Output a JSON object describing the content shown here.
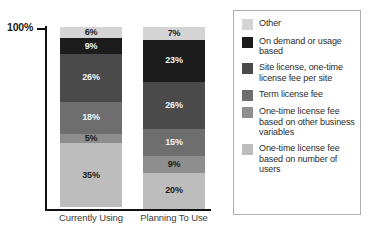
{
  "chart_data": {
    "type": "bar",
    "stacked": true,
    "normalized_percent": true,
    "title": "",
    "subtitle": "",
    "xlabel": "",
    "ylabel": "",
    "categories": [
      "Currently Using",
      "Planning To Use"
    ],
    "ylim": [
      0,
      100
    ],
    "ytick_labels": [
      "100%"
    ],
    "grid": false,
    "legend_position": "right",
    "series": [
      {
        "name": "One-time license fee based on number of users",
        "color": "#bdbdbd",
        "label_color": "dark",
        "values": [
          35,
          20
        ],
        "value_labels": [
          "35%",
          "20%"
        ]
      },
      {
        "name": "One-time license fee based on other business variables",
        "color": "#8e8e8e",
        "label_color": "dark",
        "values": [
          5,
          9
        ],
        "value_labels": [
          "5%",
          "9%"
        ]
      },
      {
        "name": "Term license fee",
        "color": "#6e6e6e",
        "label_color": "light",
        "values": [
          18,
          15
        ],
        "value_labels": [
          "18%",
          "15%"
        ]
      },
      {
        "name": "Site license, one-time license fee per site",
        "color": "#4a4a4a",
        "label_color": "light",
        "values": [
          26,
          26
        ],
        "value_labels": [
          "26%",
          "26%"
        ]
      },
      {
        "name": "On demand or usage based",
        "color": "#1c1c1c",
        "label_color": "light",
        "values": [
          9,
          23
        ],
        "value_labels": [
          "9%",
          "23%"
        ]
      },
      {
        "name": "Other",
        "color": "#d4d4d4",
        "label_color": "dark",
        "values": [
          6,
          7
        ],
        "value_labels": [
          "6%",
          "7%"
        ]
      }
    ]
  },
  "axis": {
    "top_label": "100%"
  },
  "legend": {
    "items": [
      {
        "label": "Other",
        "color": "#d4d4d4"
      },
      {
        "label": "On demand or usage based",
        "color": "#1c1c1c"
      },
      {
        "label": "Site license, one-time license fee per site",
        "color": "#4a4a4a"
      },
      {
        "label": "Term license fee",
        "color": "#6e6e6e"
      },
      {
        "label": "One-time license fee based on other business variables",
        "color": "#8e8e8e"
      },
      {
        "label": "One-time license fee based on number of users",
        "color": "#bdbdbd"
      }
    ]
  }
}
